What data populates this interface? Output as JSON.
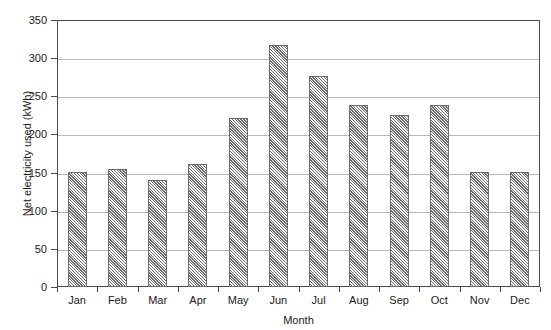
{
  "chart_data": {
    "type": "bar",
    "title": "",
    "subtitle": "",
    "xlabel": "Month",
    "ylabel": "Net electricity used (kWh)",
    "categories": [
      "Jan",
      "Feb",
      "Mar",
      "Apr",
      "May",
      "Jun",
      "Jul",
      "Aug",
      "Sep",
      "Oct",
      "Nov",
      "Dec"
    ],
    "values": [
      151,
      155,
      140,
      161,
      222,
      317,
      277,
      239,
      226,
      239,
      151,
      151
    ],
    "ylim": [
      0,
      350
    ],
    "ytick_labels": [
      "0",
      "50",
      "100",
      "150",
      "200",
      "250",
      "300",
      "350"
    ],
    "ytick_values": [
      0,
      50,
      100,
      150,
      200,
      250,
      300,
      350
    ],
    "grid": "horizontal",
    "legend": "none",
    "bar_fill": "#d8d8d8",
    "bar_pattern": "diagonal-hatch",
    "bar_edge_color": "#6b6b6b",
    "grid_color": "#b9b9b9",
    "axis_color": "#4a4a4a",
    "background": "#ffffff"
  },
  "axes": {
    "y_title": "Net electricity used (kWh)",
    "x_title": "Month"
  }
}
